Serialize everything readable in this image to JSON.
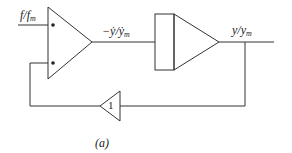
{
  "diagram": {
    "type": "block-diagram",
    "caption": "(a)",
    "colors": {
      "stroke": "#333333",
      "background": "#ffffff"
    },
    "labels": {
      "input": {
        "main": "f/f",
        "sub": "m"
      },
      "integrator_output": {
        "main": "−ẏ/ẏ",
        "sub": "m"
      },
      "output": {
        "main": "y/y",
        "sub": "m"
      },
      "feedback_gain": "1"
    },
    "blocks": [
      {
        "id": "integrator-1",
        "kind": "integrator-triangle",
        "inputs": 2
      },
      {
        "id": "integrator-2",
        "kind": "integrator-box-triangle",
        "inputs": 1
      },
      {
        "id": "feedback-gain",
        "kind": "gain-triangle",
        "value": "1"
      }
    ],
    "connections": [
      "input f/f_m -> integrator-1 (top input)",
      "integrator-1 -> integrator-2 (signal -ẏ/ẏ_m)",
      "integrator-2 -> output (signal y/y_m)",
      "output -> feedback-gain -> integrator-1 (bottom input)"
    ]
  }
}
